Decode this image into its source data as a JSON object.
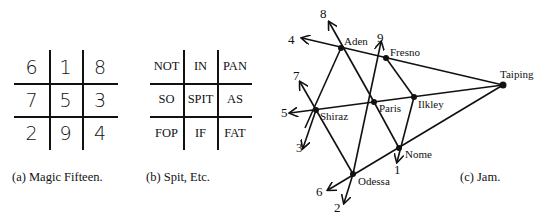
{
  "panels": {
    "magic": {
      "caption": "(a) Magic Fifteen.",
      "cells": [
        [
          "6",
          "1",
          "8"
        ],
        [
          "7",
          "5",
          "3"
        ],
        [
          "2",
          "9",
          "4"
        ]
      ]
    },
    "spit": {
      "caption": "(b) Spit, Etc.",
      "cells": [
        [
          "NOT",
          "IN",
          "PAN"
        ],
        [
          "SO",
          "SPIT",
          "AS"
        ],
        [
          "FOP",
          "IF",
          "FAT"
        ]
      ]
    },
    "jam": {
      "caption": "(c) Jam.",
      "nodes": [
        {
          "name": "Aden",
          "x": 341,
          "y": 48
        },
        {
          "name": "Fresno",
          "x": 386,
          "y": 58
        },
        {
          "name": "Paris",
          "x": 374,
          "y": 102
        },
        {
          "name": "Ilkley",
          "x": 414,
          "y": 97
        },
        {
          "name": "Shiraz",
          "x": 316,
          "y": 110
        },
        {
          "name": "Nome",
          "x": 399,
          "y": 148
        },
        {
          "name": "Odessa",
          "x": 353,
          "y": 174
        },
        {
          "name": "Taiping",
          "x": 503,
          "y": 85
        }
      ],
      "arrow_labels": [
        "1",
        "2",
        "3",
        "4",
        "5",
        "6",
        "7",
        "8",
        "9"
      ]
    }
  }
}
